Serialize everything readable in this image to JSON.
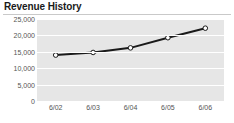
{
  "panel": {
    "title": "Revenue History"
  },
  "chart_data": {
    "type": "line",
    "title": "Revenue History",
    "xlabel": "",
    "ylabel": "",
    "categories": [
      "6/02",
      "6/03",
      "6/04",
      "6/05",
      "6/06"
    ],
    "values": [
      14000,
      14800,
      16200,
      19300,
      22200
    ],
    "series": [
      {
        "name": "Revenue",
        "values": [
          14000,
          14800,
          16200,
          19300,
          22200
        ]
      }
    ],
    "ylim": [
      0,
      25000
    ],
    "ytick_labels": [
      "25,000",
      "20,000",
      "15,000",
      "10,000",
      "5,000",
      "0"
    ],
    "ytick_values": [
      25000,
      20000,
      15000,
      10000,
      5000,
      0
    ],
    "grid": true,
    "legend": "none",
    "marker": "open-circle",
    "line_color": "#1a1a1a",
    "marker_fill": "#ffffff",
    "plot_background": "#e6e6e6",
    "gridline_color": "#ffffff",
    "axis_text_color": "#545454"
  }
}
